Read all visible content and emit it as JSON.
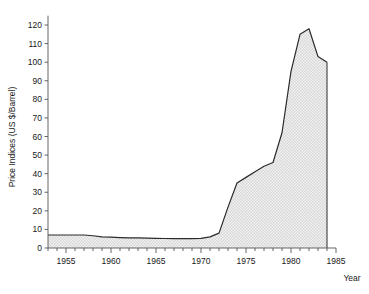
{
  "chart_data": {
    "type": "area",
    "title": "",
    "xlabel": "Year",
    "ylabel": "Price Indices (US $/Barrel)",
    "xlim": [
      1953,
      1985
    ],
    "ylim": [
      0,
      125
    ],
    "xticks": [
      1955,
      1960,
      1965,
      1970,
      1975,
      1980,
      1985
    ],
    "xtick_labels": [
      "1955",
      "1960",
      "1965",
      "1970",
      "1975",
      "1980",
      "1985"
    ],
    "yticks": [
      0,
      10,
      20,
      30,
      40,
      50,
      60,
      70,
      80,
      90,
      100,
      110,
      120
    ],
    "ytick_labels": [
      "0",
      "10",
      "20",
      "30",
      "40",
      "50",
      "60",
      "70",
      "80",
      "90",
      "100",
      "110",
      "120"
    ],
    "minor_xticks_every": 1,
    "grid": false,
    "legend": null,
    "fill": "hatched-dotted-gray",
    "line_color": "#2b2b2b",
    "fill_color": "#e8e8e8",
    "axis_color": "#555555",
    "x": [
      1953,
      1954,
      1955,
      1956,
      1957,
      1958,
      1959,
      1960,
      1961,
      1962,
      1963,
      1964,
      1965,
      1966,
      1967,
      1968,
      1969,
      1970,
      1971,
      1972,
      1973,
      1974,
      1975,
      1976,
      1977,
      1978,
      1979,
      1980,
      1981,
      1982,
      1983,
      1984
    ],
    "values": [
      7.0,
      7.0,
      7.0,
      7.0,
      7.0,
      6.6,
      6.0,
      5.8,
      5.6,
      5.5,
      5.4,
      5.3,
      5.2,
      5.1,
      5.0,
      5.0,
      5.0,
      5.2,
      6.0,
      8.0,
      22.0,
      35.0,
      38.0,
      41.0,
      44.0,
      46.0,
      62.0,
      95.0,
      115.0,
      118.0,
      103.0,
      100.0
    ],
    "series_name": "Oil price index"
  },
  "axes": {
    "y_axis_title": "Price Indices (US $/Barrel)",
    "x_axis_title": "Year"
  }
}
